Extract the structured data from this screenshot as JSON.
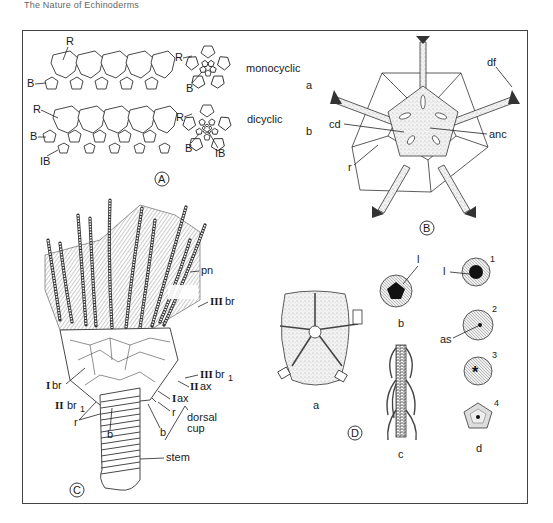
{
  "header": {
    "text": "The Nature of Echinoderms"
  },
  "figure": {
    "panels": [
      {
        "id": "A",
        "label": "A",
        "rows": [
          {
            "name": "monocyclic",
            "labels": [
              "R",
              "B"
            ],
            "ring_labels": [
              "R",
              "B"
            ]
          },
          {
            "name": "dicyclic",
            "labels": [
              "R",
              "B",
              "IB"
            ],
            "ring_labels": [
              "R",
              "B",
              "IB"
            ]
          }
        ]
      },
      {
        "id": "B",
        "label": "B",
        "side_labels": [
          "a",
          "b"
        ],
        "labels": {
          "df": "df",
          "cd": "cd",
          "anc": "anc",
          "r": "r"
        }
      },
      {
        "id": "C",
        "label": "C",
        "labels": {
          "pn": "pn",
          "IIIbr": "br",
          "IIIbr1": "br",
          "IIax": "ax",
          "Iax": "ax",
          "Ibr": "br",
          "IIbr1": "br",
          "r_left": "r",
          "r_right": "r",
          "b_left": "b",
          "b_right": "b",
          "dorsal_cup": [
            "dorsal",
            "cup"
          ],
          "stem": "stem"
        },
        "roman": {
          "III": "III",
          "II": "II",
          "I": "I",
          "sub1": "1"
        }
      },
      {
        "id": "D",
        "label": "D",
        "sublabels": [
          "a",
          "b",
          "c",
          "d"
        ],
        "labels": {
          "l_b": "l",
          "l_d1": "l",
          "as": "as"
        },
        "stages": [
          "1",
          "2",
          "3",
          "4"
        ]
      }
    ]
  }
}
